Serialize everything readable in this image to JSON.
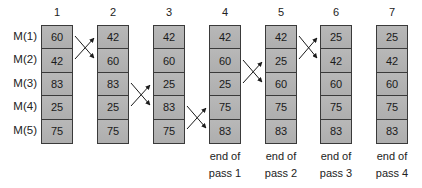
{
  "diagram": {
    "row_labels": [
      "M(1)",
      "M(2)",
      "M(3)",
      "M(4)",
      "M(5)"
    ],
    "columns": [
      {
        "header": "1",
        "values": [
          "60",
          "42",
          "83",
          "25",
          "75"
        ],
        "caption": [
          "",
          ""
        ]
      },
      {
        "header": "2",
        "values": [
          "42",
          "60",
          "83",
          "25",
          "75"
        ],
        "caption": [
          "",
          ""
        ]
      },
      {
        "header": "3",
        "values": [
          "42",
          "60",
          "25",
          "83",
          "75"
        ],
        "caption": [
          "",
          ""
        ]
      },
      {
        "header": "4",
        "values": [
          "42",
          "60",
          "25",
          "75",
          "83"
        ],
        "caption": [
          "end of",
          "pass 1"
        ]
      },
      {
        "header": "5",
        "values": [
          "42",
          "25",
          "60",
          "75",
          "83"
        ],
        "caption": [
          "end of",
          "pass 2"
        ]
      },
      {
        "header": "6",
        "values": [
          "25",
          "42",
          "60",
          "75",
          "83"
        ],
        "caption": [
          "end of",
          "pass 3"
        ]
      },
      {
        "header": "7",
        "values": [
          "25",
          "42",
          "60",
          "75",
          "83"
        ],
        "caption": [
          "end of",
          "pass 4"
        ]
      }
    ],
    "swaps": [
      {
        "from_column": 1,
        "to_column": 2,
        "rows": [
          1,
          2
        ]
      },
      {
        "from_column": 2,
        "to_column": 3,
        "rows": [
          3,
          4
        ]
      },
      {
        "from_column": 3,
        "to_column": 4,
        "rows": [
          4,
          5
        ]
      },
      {
        "from_column": 4,
        "to_column": 5,
        "rows": [
          2,
          3
        ]
      },
      {
        "from_column": 5,
        "to_column": 6,
        "rows": [
          1,
          2
        ]
      }
    ],
    "colors": {
      "cell_fill": "#b3b3b3",
      "border": "#3a3a3a",
      "arrow": "#1a1a1a"
    }
  }
}
